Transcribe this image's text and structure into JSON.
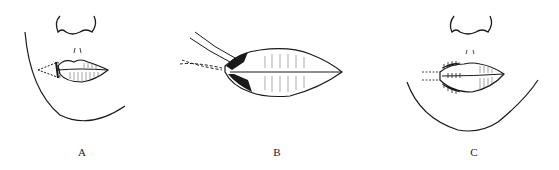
{
  "figure": {
    "panels": [
      {
        "id": "A",
        "label": "A",
        "description": "Face with lip lesion at left commissure; wedge excision marked"
      },
      {
        "id": "B",
        "label": "B",
        "description": "Enlarged lip with sutures/traction threads at commissure"
      },
      {
        "id": "C",
        "label": "C",
        "description": "Face after repair with interrupted sutures at left commissure"
      }
    ],
    "colors": {
      "ink": "#1a1a1a",
      "background": "#ffffff"
    }
  }
}
